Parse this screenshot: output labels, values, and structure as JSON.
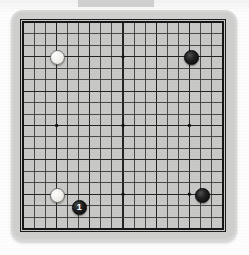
{
  "diagram": {
    "type": "go-board-diagram",
    "board_size": 19,
    "title": "",
    "top_artifact_label": "",
    "colors": {
      "board_surface": "#c8c8c6",
      "bezel": "#d8d8d6",
      "grid_line": "#3a3a3a",
      "grid_line_heavy": "#242424",
      "board_edge": "#161616",
      "star_point": "#131313",
      "black_stone": "#0d0d0d",
      "white_stone": "#f3f2ed",
      "page_background": "#fdfdfd"
    },
    "geometry": {
      "board_left": 20,
      "board_top": 19,
      "board_width": 206,
      "board_height": 213,
      "cell_width": 11.4,
      "cell_height": 11.8,
      "stone_diameter": 15
    },
    "star_points": [
      {
        "col": 4,
        "row": 4
      },
      {
        "col": 10,
        "row": 4
      },
      {
        "col": 16,
        "row": 4
      },
      {
        "col": 4,
        "row": 10
      },
      {
        "col": 10,
        "row": 10
      },
      {
        "col": 16,
        "row": 10
      },
      {
        "col": 4,
        "row": 16
      },
      {
        "col": 10,
        "row": 16
      },
      {
        "col": 16,
        "row": 16
      }
    ],
    "stones": [
      {
        "id": "white-stone-top-left",
        "color": "white",
        "col": 4,
        "row": 4,
        "label": "",
        "coordinate": "D16"
      },
      {
        "id": "black-stone-top-right",
        "color": "black",
        "col": 16,
        "row": 4,
        "label": "",
        "coordinate": "Q16"
      },
      {
        "id": "white-stone-bottom-left",
        "color": "white",
        "col": 4,
        "row": 16,
        "label": "",
        "coordinate": "D4"
      },
      {
        "id": "black-stone-move-one",
        "color": "black",
        "col": 6,
        "row": 17,
        "label": "1",
        "coordinate": "F3"
      },
      {
        "id": "black-stone-bottom-right",
        "color": "black",
        "col": 17,
        "row": 16,
        "label": "",
        "coordinate": "R4"
      }
    ]
  }
}
